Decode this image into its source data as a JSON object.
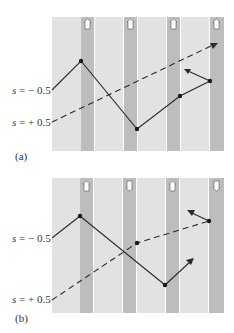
{
  "figure": {
    "panels": [
      {
        "id": "a",
        "caption": "(a)",
        "labels": [
          {
            "text": "s = −0.5",
            "var": "s",
            "rest": " = −0.5"
          },
          {
            "text": "s = +0.5",
            "var": "s",
            "rest": " = +0.5"
          }
        ],
        "spin_arrows": [
          "up",
          "up",
          "up",
          "up"
        ]
      },
      {
        "id": "b",
        "caption": "(b)",
        "labels": [
          {
            "text": "s = −0.5",
            "var": "s",
            "rest": " = −0.5"
          },
          {
            "text": "s = +0.5",
            "var": "s",
            "rest": " = +0.5"
          }
        ],
        "spin_arrows": [
          "up",
          "down",
          "up",
          "down"
        ]
      }
    ],
    "colors": {
      "light_band": "#e2e2e2",
      "dark_band": "#bdbdbd",
      "separator": "#ffffff",
      "line": "#2a2a2a"
    }
  }
}
